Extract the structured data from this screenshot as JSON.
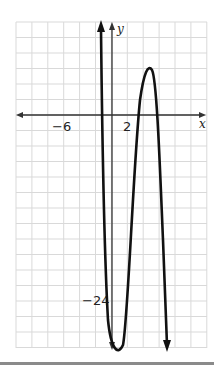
{
  "chart_data": {
    "type": "line",
    "title": "",
    "xlabel": "x",
    "ylabel": "y",
    "x_tick_labels": [
      {
        "value": -6,
        "label": "−6"
      },
      {
        "value": 2,
        "label": "2"
      }
    ],
    "y_tick_labels": [
      {
        "value": -24,
        "label": "−24"
      }
    ],
    "xlim": [
      -12,
      12
    ],
    "ylim": [
      -30,
      14
    ],
    "grid": true,
    "grid_step": 2,
    "legend": null,
    "series": [
      {
        "name": "f(x)",
        "description": "quartic-like curve with arrows at both ends, both ends pointing downward-off-graph at top-left (up) and bottom-right (down)",
        "key_points": [
          {
            "x": -1.4,
            "y": 14,
            "note": "arrow exits top"
          },
          {
            "x": -1.3,
            "y": 0,
            "note": "x-intercept"
          },
          {
            "x": 1,
            "y": -30,
            "note": "local minimum"
          },
          {
            "x": 3.5,
            "y": 0,
            "note": "x-intercept"
          },
          {
            "x": 4.6,
            "y": 6,
            "note": "local maximum"
          },
          {
            "x": 5.6,
            "y": 0,
            "note": "x-intercept"
          },
          {
            "x": 6.6,
            "y": -30,
            "note": "arrow exits bottom"
          }
        ]
      }
    ]
  },
  "labels": {
    "x_axis": "x",
    "y_axis": "y",
    "tick_neg6": "−6",
    "tick_2": "2",
    "tick_neg24": "−24"
  },
  "colors": {
    "grid": "#d9d9d9",
    "axis": "#333333",
    "curve": "#111111"
  }
}
